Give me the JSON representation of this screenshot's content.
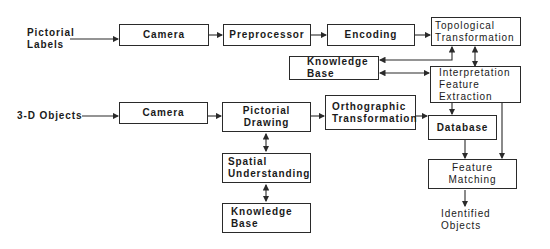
{
  "diagram": {
    "inputs": {
      "pictorial_labels": [
        "Pictorial",
        "Labels"
      ],
      "objects_3d": "3-D Objects"
    },
    "top_row": {
      "camera": "Camera",
      "preprocessor": "Preprocessor",
      "encoding": "Encoding",
      "topological": [
        "Topological",
        "Transformation"
      ]
    },
    "knowledge_base_top": [
      "Knowledge",
      "Base"
    ],
    "interpretation": [
      "Interpretation",
      "Feature",
      "Extraction"
    ],
    "bottom_row": {
      "camera": "Camera",
      "pictorial_drawing": [
        "Pictorial",
        "Drawing"
      ],
      "orthographic": [
        "Orthographic",
        "Transformation"
      ],
      "database": "Database"
    },
    "spatial_understanding": [
      "Spatial",
      "Understanding"
    ],
    "knowledge_base_bottom": [
      "Knowledge",
      "Base"
    ],
    "feature_matching": [
      "Feature",
      "Matching"
    ],
    "output": [
      "Identified",
      "Objects"
    ]
  },
  "colors": {
    "line": "#2a2a2a",
    "background": "#ffffff"
  }
}
